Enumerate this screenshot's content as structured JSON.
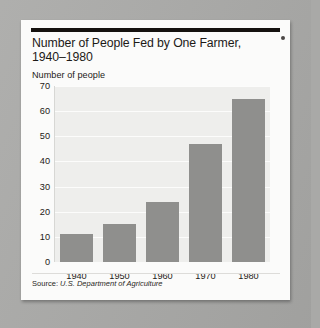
{
  "figure": {
    "source_note_lead": "Source:",
    "source_note": "U.S. Department of Agriculture",
    "corner_mark": "bullet-dot"
  },
  "chart_data": {
    "type": "bar",
    "title": "Number of People Fed by One Farmer, 1940–1980",
    "title_line1": "Number of People Fed by One Farmer,",
    "title_line2": "1940–1980",
    "subtitle": "",
    "ylabel": "Number of people",
    "xlabel": "",
    "categories": [
      "1940",
      "1950",
      "1960",
      "1970",
      "1980"
    ],
    "values": [
      11,
      15,
      24,
      47,
      65
    ],
    "ylim": [
      0,
      70
    ],
    "ytick_step": 10,
    "yticks": [
      "0",
      "10",
      "20",
      "30",
      "40",
      "50",
      "60",
      "70"
    ],
    "grid": true,
    "grid_axis": "y",
    "legend": false,
    "legend_position": "none",
    "bar_color": "#8f8f8d",
    "plot_background": "#eeeeec",
    "gridline_color": "#fcfcfb",
    "text_color": "#1d1a17"
  }
}
